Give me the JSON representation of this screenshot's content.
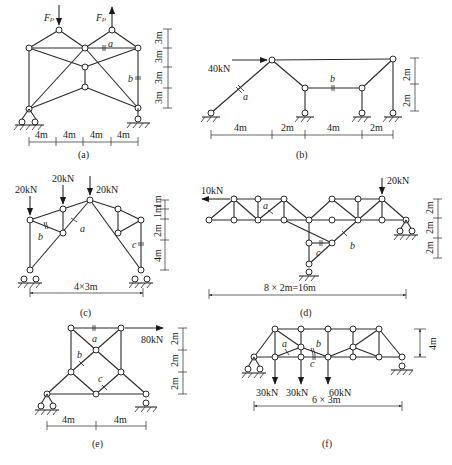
{
  "figure": {
    "panels": [
      {
        "id": "a",
        "caption": "(a)",
        "loads": [
          {
            "label": "F_P",
            "display": "Fₚ",
            "direction": "down"
          },
          {
            "label": "F_P",
            "display": "Fₚ",
            "direction": "up"
          }
        ],
        "members_marked": [
          "a",
          "b"
        ],
        "horizontal_dims": [
          "4m",
          "4m",
          "4m",
          "4m"
        ],
        "vertical_dims": [
          "3m",
          "3m",
          "3m",
          "3m"
        ]
      },
      {
        "id": "b",
        "caption": "(b)",
        "loads": [
          {
            "label": "40kN",
            "direction": "right"
          }
        ],
        "members_marked": [
          "a",
          "b"
        ],
        "horizontal_dims": [
          "4m",
          "2m",
          "4m",
          "2m"
        ],
        "vertical_dims": [
          "2m",
          "2m"
        ]
      },
      {
        "id": "c",
        "caption": "(c)",
        "loads": [
          {
            "label": "20kN",
            "direction": "down"
          },
          {
            "label": "20kN",
            "direction": "down"
          },
          {
            "label": "20kN",
            "direction": "down"
          }
        ],
        "members_marked": [
          "a",
          "b",
          "c"
        ],
        "horizontal_dims": [
          "4×3m"
        ],
        "vertical_dims": [
          "1m",
          "1m",
          "2m",
          "4m"
        ]
      },
      {
        "id": "d",
        "caption": "(d)",
        "loads": [
          {
            "label": "10kN",
            "direction": "left"
          },
          {
            "label": "20kN",
            "direction": "down"
          }
        ],
        "members_marked": [
          "a",
          "b",
          "c"
        ],
        "horizontal_dims": [
          "8 × 2m=16m"
        ],
        "vertical_dims": [
          "2m",
          "2m",
          "2m"
        ]
      },
      {
        "id": "e",
        "caption": "(e)",
        "loads": [
          {
            "label": "80kN",
            "direction": "right"
          }
        ],
        "members_marked": [
          "a",
          "b",
          "c"
        ],
        "horizontal_dims": [
          "4m",
          "4m"
        ],
        "vertical_dims": [
          "2m",
          "2m",
          "2m"
        ]
      },
      {
        "id": "f",
        "caption": "(f)",
        "loads": [
          {
            "label": "30kN",
            "direction": "down"
          },
          {
            "label": "30kN",
            "direction": "down"
          },
          {
            "label": "60kN",
            "direction": "down"
          }
        ],
        "members_marked": [
          "a",
          "b",
          "c"
        ],
        "horizontal_dims": [
          "6 × 3m"
        ],
        "vertical_dims": [
          "4m"
        ]
      }
    ]
  },
  "labels": {
    "a": {
      "caption": "(a)",
      "load1": "Fₚ",
      "load2": "Fₚ",
      "ma": "a",
      "mb": "b",
      "h": [
        "4m",
        "4m",
        "4m",
        "4m"
      ],
      "v": [
        "3m",
        "3m",
        "3m",
        "3m"
      ]
    },
    "b": {
      "caption": "(b)",
      "load": "40kN",
      "ma": "a",
      "mb": "b",
      "h": [
        "4m",
        "2m",
        "4m",
        "2m"
      ],
      "v": [
        "2m",
        "2m"
      ]
    },
    "c": {
      "caption": "(c)",
      "load1": "20kN",
      "load2": "20kN",
      "load3": "20kN",
      "ma": "a",
      "mb": "b",
      "mc": "c",
      "h": "4×3m",
      "v": [
        "1m",
        "1m",
        "2m",
        "4m"
      ]
    },
    "d": {
      "caption": "(d)",
      "load1": "10kN",
      "load2": "20kN",
      "ma": "a",
      "mb": "b",
      "mc": "c",
      "h": "8 × 2m=16m",
      "v": [
        "2m",
        "2m",
        "2m"
      ]
    },
    "e": {
      "caption": "(e)",
      "load": "80kN",
      "ma": "a",
      "mb": "b",
      "mc": "c",
      "h": [
        "4m",
        "4m"
      ],
      "v": [
        "2m",
        "2m",
        "2m"
      ]
    },
    "f": {
      "caption": "(f)",
      "load1": "30kN",
      "load2": "30kN",
      "load3": "60kN",
      "ma": "a",
      "mb": "b",
      "mc": "c",
      "h": "6 × 3m",
      "v": "4m"
    }
  }
}
